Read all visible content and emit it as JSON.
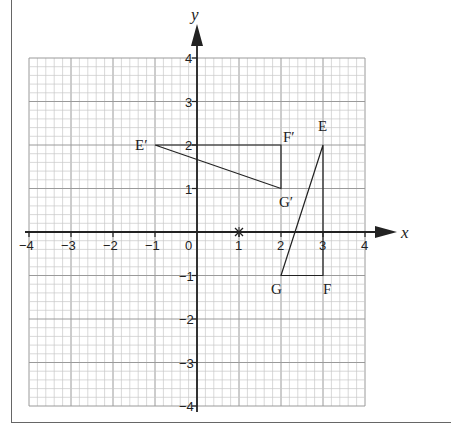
{
  "diagram": {
    "type": "coordinate-grid",
    "axes": {
      "x_label": "x",
      "y_label": "y",
      "x_range": [
        -4,
        4
      ],
      "y_range": [
        -4,
        4
      ],
      "x_ticks": [
        "-4",
        "-3",
        "-2",
        "-1",
        "0",
        "1",
        "2",
        "3",
        "4"
      ],
      "y_ticks": [
        "4",
        "3",
        "2",
        "1",
        "-1",
        "-2",
        "-3",
        "-4"
      ],
      "minor_step": 0.2
    },
    "marker": {
      "label": "×",
      "x": 1,
      "y": 0
    },
    "triangle_EFG": {
      "vertices": [
        {
          "label": "E",
          "x": 3,
          "y": 2
        },
        {
          "label": "F",
          "x": 3,
          "y": -1
        },
        {
          "label": "G",
          "x": 2,
          "y": -1
        }
      ]
    },
    "triangle_EFG_prime": {
      "vertices": [
        {
          "label": "E′",
          "x": -1,
          "y": 2
        },
        {
          "label": "F′",
          "x": 2,
          "y": 2
        },
        {
          "label": "G′",
          "x": 2,
          "y": 1
        }
      ]
    },
    "colors": {
      "grid_minor": "#c8c8c8",
      "grid_major": "#9a9a9a",
      "ink": "#222222"
    }
  }
}
